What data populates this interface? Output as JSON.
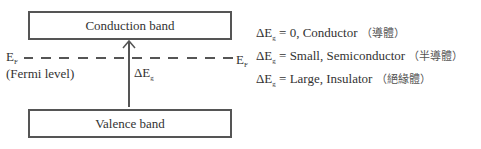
{
  "diagram": {
    "conduction_band": {
      "label": "Conduction band"
    },
    "valence_band": {
      "label": "Valence band"
    },
    "fermi": {
      "left_label": "E",
      "left_sub": "F",
      "right_label": "E",
      "right_sub": "F",
      "caption": "(Fermi level)"
    },
    "gap_label": {
      "main": "ΔE",
      "sub": "g"
    },
    "legend": [
      {
        "prefix": "ΔE",
        "sub": "g",
        "text": " = 0, Conductor ",
        "cjk": "（導體）"
      },
      {
        "prefix": "ΔE",
        "sub": "g",
        "text": " = Small, Semiconductor ",
        "cjk": "（半導體）"
      },
      {
        "prefix": "ΔE",
        "sub": "g",
        "text": " = Large, Insulator ",
        "cjk": "（絕緣體）"
      }
    ]
  }
}
